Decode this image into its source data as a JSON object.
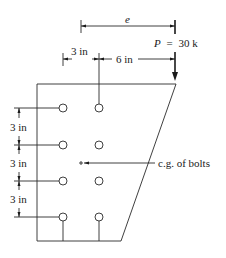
{
  "diagram": {
    "type": "bolted-bracket-eccentric-load",
    "load": {
      "symbol": "P",
      "equals": "=",
      "value": "30 k"
    },
    "eccentricity_label": "e",
    "horizontal_dims": [
      {
        "label": "3 in"
      },
      {
        "label": "6 in"
      }
    ],
    "vertical_dims": [
      {
        "label": "3 in"
      },
      {
        "label": "3 in"
      },
      {
        "label": "3 in"
      }
    ],
    "cg_label": "c.g. of bolts",
    "bolt_pattern": {
      "rows": 4,
      "columns": 2,
      "row_spacing": "3 in",
      "column_spacing": "3 in"
    }
  }
}
